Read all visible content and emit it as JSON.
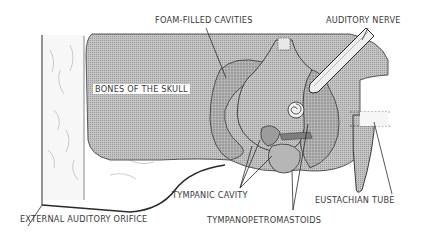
{
  "diagram": {
    "labels": {
      "foam_filled_cavities": "FOAM-FILLED CAVITIES",
      "auditory_nerve": "AUDITORY NERVE",
      "bones_of_the_skull": "BONES OF THE SKULL",
      "tympanic_cavity": "TYMPANIC CAVITY",
      "eustachian_tube": "EUSTACHIAN TUBE",
      "external_auditory_orifice": "EXTERNAL AUDITORY ORIFICE",
      "tympanopetromastoids": "TYMPANOPETROMASTOIDS"
    },
    "colors": {
      "line": "#2a2a2a",
      "bone_fill": "#b8b8b8",
      "foam_fill": "#a9a9a9",
      "tissue_fill": "#f4f4f4",
      "background": "#ffffff"
    }
  }
}
